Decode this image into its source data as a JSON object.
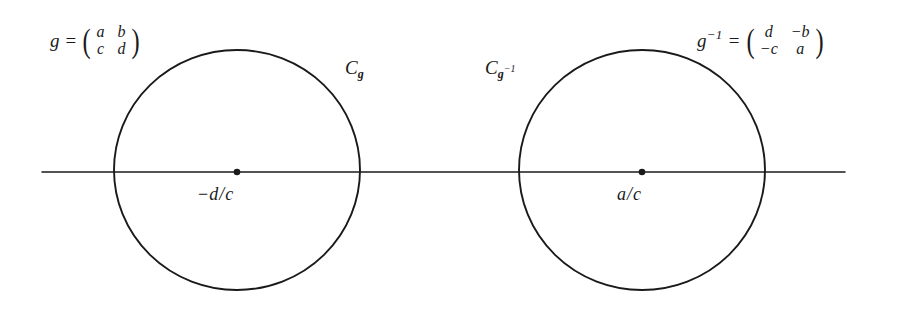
{
  "figure": {
    "background_color": "#ffffff",
    "stroke_color": "#1a1a1a",
    "axis": {
      "label": "real-axis",
      "x_start": 42,
      "x_end": 845,
      "y": 172
    },
    "circles": [
      {
        "name": "C_g",
        "label": "C",
        "label_sub": "g",
        "center_label_prefix": "−",
        "center_label_numerator": "d",
        "center_label_slash": "/",
        "center_label_denominator": "c",
        "cx": 237,
        "cy": 170,
        "rx": 123,
        "ry": 120
      },
      {
        "name": "C_g_inverse",
        "label": "C",
        "label_sub": "g",
        "label_sub_sup": "−1",
        "center_label_numerator": "a",
        "center_label_slash": "/",
        "center_label_denominator": "c",
        "cx": 642,
        "cy": 170,
        "rx": 123,
        "ry": 120
      }
    ],
    "equations": [
      {
        "name": "matrix-g",
        "var": "g",
        "superscript": "",
        "equals": "=",
        "entries": [
          "a",
          "b",
          "c",
          "d"
        ],
        "paren_left": "(",
        "paren_right": ")"
      },
      {
        "name": "matrix-g-inverse",
        "var": "g",
        "superscript": "−1",
        "equals": "=",
        "entries": [
          "d",
          "−b",
          "−c",
          "a"
        ],
        "paren_left": "(",
        "paren_right": ")"
      }
    ]
  }
}
